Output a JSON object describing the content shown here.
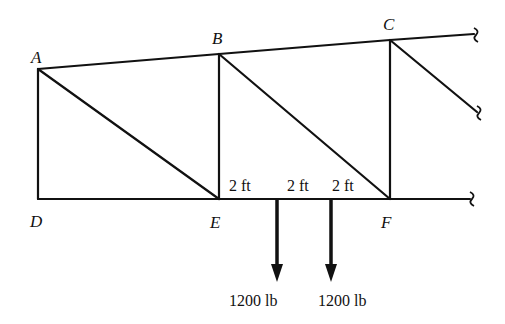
{
  "diagram": {
    "type": "truss",
    "nodes": {
      "A": {
        "label": "A",
        "x": 38,
        "y": 69
      },
      "B": {
        "label": "B",
        "x": 219,
        "y": 54
      },
      "C": {
        "label": "C",
        "x": 390,
        "y": 40
      },
      "D": {
        "label": "D",
        "x": 38,
        "y": 199
      },
      "E": {
        "label": "E",
        "x": 219,
        "y": 199
      },
      "F": {
        "label": "F",
        "x": 390,
        "y": 199
      }
    },
    "members": [
      "A-B",
      "B-C",
      "C-continues",
      "A-D",
      "A-E",
      "B-E",
      "B-F",
      "C-F",
      "C-diagonal-continues",
      "D-E",
      "E-F",
      "F-continues"
    ],
    "dimensions": [
      {
        "label": "2 ft",
        "x": 228,
        "y": 190
      },
      {
        "label": "2 ft",
        "x": 286,
        "y": 190
      },
      {
        "label": "2 ft",
        "x": 332,
        "y": 190
      }
    ],
    "loads": [
      {
        "label": "1200 lb",
        "x": 277,
        "magnitude": 1200,
        "unit": "lb",
        "direction": "down"
      },
      {
        "label": "1200 lb",
        "x": 331,
        "magnitude": 1200,
        "unit": "lb",
        "direction": "down"
      }
    ]
  }
}
